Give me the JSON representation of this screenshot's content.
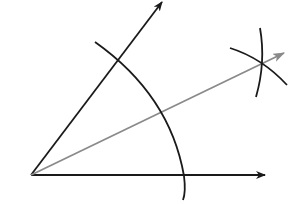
{
  "diagram": {
    "colors": {
      "background": "#ffffff",
      "ray": "#1a1a1a",
      "bisector": "#8a8a8a",
      "arc": "#1a1a1a"
    },
    "vertex": {
      "x": 31,
      "y": 175
    },
    "rays": [
      {
        "name": "horizontal-ray",
        "from": [
          31,
          175
        ],
        "to": [
          265,
          175
        ]
      },
      {
        "name": "upper-ray",
        "from": [
          31,
          175
        ],
        "to": [
          162,
          2
        ]
      }
    ],
    "bisector": {
      "from": [
        31,
        175
      ],
      "to": [
        284,
        53
      ]
    },
    "arcs": [
      {
        "name": "large-arc",
        "path": "M95,42 Q170,95 184,176 Q186,192 183,200"
      },
      {
        "name": "small-arc-1",
        "path": "M230,48 Q262,58 287,85"
      },
      {
        "name": "small-arc-2",
        "path": "M260,28 Q266,62 256,97"
      }
    ]
  }
}
